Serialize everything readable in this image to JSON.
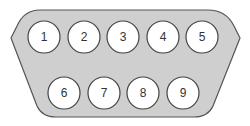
{
  "diagram": {
    "type": "DB9 connector pinout",
    "colors": {
      "shell_fill": "#cfcfcf",
      "shell_stroke": "#555555",
      "pin_fill": "#ffffff",
      "pin_stroke": "#444444",
      "label": "#333333"
    },
    "top_row": [
      {
        "label": "1",
        "cx": 44,
        "cy": 37
      },
      {
        "label": "2",
        "cx": 84,
        "cy": 37
      },
      {
        "label": "3",
        "cx": 123,
        "cy": 37
      },
      {
        "label": "4",
        "cx": 163,
        "cy": 37
      },
      {
        "label": "5",
        "cx": 202,
        "cy": 37
      }
    ],
    "bottom_row": [
      {
        "label": "6",
        "cx": 64,
        "cy": 93
      },
      {
        "label": "7",
        "cx": 104,
        "cy": 93
      },
      {
        "label": "8",
        "cx": 143,
        "cy": 93
      },
      {
        "label": "9",
        "cx": 183,
        "cy": 93
      }
    ],
    "pin_radius": 16
  }
}
